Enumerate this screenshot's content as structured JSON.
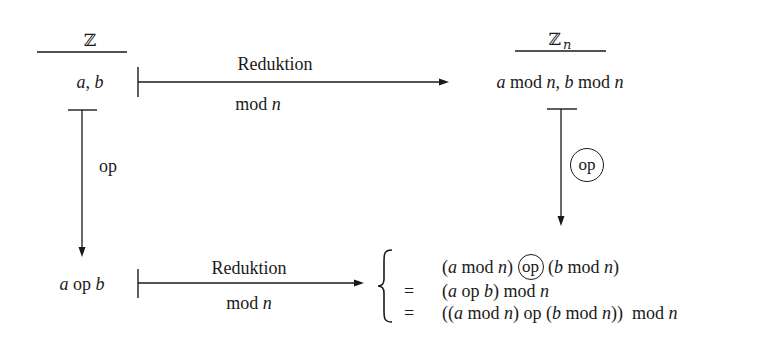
{
  "diagram": {
    "top_left": {
      "set_symbol": "ℤ",
      "elements": [
        "a",
        ", ",
        "b"
      ]
    },
    "top_right": {
      "set_symbol": "ℤ",
      "set_subscript": "n",
      "element_a": "a",
      "element_mod1": " mod ",
      "element_n1": "n",
      "element_sep": ", ",
      "element_b": "b",
      "element_mod2": " mod ",
      "element_n2": "n"
    },
    "top_arrow": {
      "label_above": "Reduktion",
      "label_below_mod": "mod ",
      "label_below_n": "n"
    },
    "left_arrow": {
      "label": "op"
    },
    "right_arrow": {
      "label": "op",
      "circled": true
    },
    "bottom_left": {
      "a": "a",
      "op": " op ",
      "b": "b"
    },
    "bottom_arrow": {
      "label_above": "Reduktion",
      "label_below_mod": "mod ",
      "label_below_n": "n"
    },
    "result_rows": [
      {
        "relation": "",
        "expression": "(a mod n) (op) (b mod n)"
      },
      {
        "relation": "=",
        "expression": "(a op b) mod n"
      },
      {
        "relation": "=",
        "expression": "((a mod n) op (b mod n)) mod n"
      }
    ],
    "result_parts": {
      "row0": {
        "p1": "(",
        "a": "a",
        "mod": " mod ",
        "n": "n",
        "p2": ") ",
        "op": "op",
        "p3": " (",
        "b": "b",
        "mod2": " mod ",
        "n2": "n",
        "p4": ")"
      },
      "row1": {
        "eq": "=",
        "p1": "(",
        "a": "a",
        "op": " op ",
        "b": "b",
        "p2": ") mod ",
        "n": "n"
      },
      "row2": {
        "eq": "=",
        "p1": "((",
        "a": "a",
        "mod": " mod ",
        "n": "n",
        "p2": ") op (",
        "b": "b",
        "mod2": " mod ",
        "n2": "n",
        "p3": "))  mod ",
        "n3": "n"
      }
    },
    "colors": {
      "ink": "#1a1a1a",
      "background": "#ffffff"
    }
  }
}
